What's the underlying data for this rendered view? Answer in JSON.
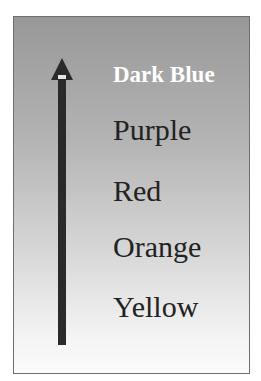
{
  "diagram": {
    "type": "ordered-scale",
    "direction": "up",
    "arrow_color": "#2a2a2a",
    "labels": [
      {
        "text": "Dark Blue",
        "emphasis": "bold",
        "color": "#ffffff"
      },
      {
        "text": "Purple",
        "color": "#222222"
      },
      {
        "text": "Red",
        "color": "#222222"
      },
      {
        "text": "Orange",
        "color": "#222222"
      },
      {
        "text": "Yellow",
        "color": "#222222"
      }
    ]
  }
}
